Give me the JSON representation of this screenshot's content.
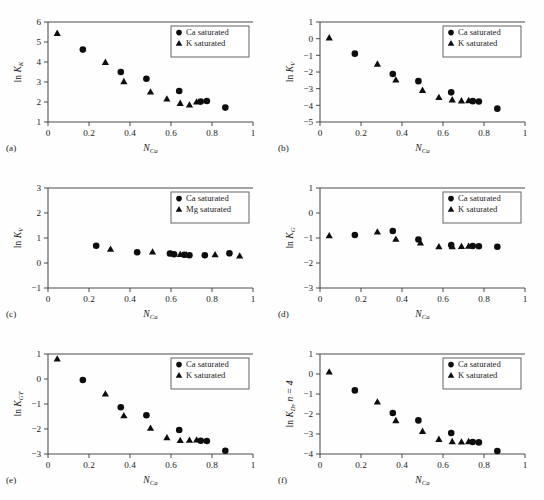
{
  "figure": {
    "width": 544,
    "height": 500,
    "background": "#fefefe",
    "marker_color": "#0d0d0d",
    "axis_color": "#4a4a4a"
  },
  "chart_data": [
    {
      "type": "scatter",
      "panel": "(a)",
      "title": "",
      "xlabel": "N_Ca",
      "ylabel": "ln K_K",
      "xlim": [
        0,
        1
      ],
      "ylim": [
        1,
        6
      ],
      "xticks": [
        0,
        0.2,
        0.4,
        0.6,
        0.8,
        1
      ],
      "xticklabels": [
        "0",
        "0.2",
        "0.4",
        "0.6",
        "0.8",
        "1"
      ],
      "yticks": [
        1,
        2,
        3,
        4,
        5,
        6
      ],
      "yticklabels": [
        "1",
        "2",
        "3",
        "4",
        "5",
        "6"
      ],
      "grid": false,
      "legend_position": "upper right",
      "series": [
        {
          "name": "Ca saturated",
          "marker": "circle",
          "x": [
            0.17,
            0.355,
            0.48,
            0.64,
            0.745,
            0.775,
            0.865
          ],
          "y": [
            4.62,
            3.5,
            3.16,
            2.55,
            2.02,
            2.05,
            1.72
          ]
        },
        {
          "name": "K saturated",
          "marker": "triangle",
          "x": [
            0.045,
            0.28,
            0.37,
            0.5,
            0.58,
            0.645,
            0.69,
            0.725
          ],
          "y": [
            5.43,
            3.98,
            3.02,
            2.5,
            2.15,
            1.93,
            1.85,
            2.0
          ]
        }
      ]
    },
    {
      "type": "scatter",
      "panel": "(b)",
      "title": "",
      "xlabel": "N_Ca",
      "ylabel": "ln K_V",
      "xlim": [
        0,
        1
      ],
      "ylim": [
        -5,
        1
      ],
      "xticks": [
        0,
        0.2,
        0.4,
        0.6,
        0.8,
        1
      ],
      "xticklabels": [
        "0",
        "0.2",
        "0.4",
        "0.6",
        "0.8",
        "1"
      ],
      "yticks": [
        -5,
        -4,
        -3,
        -2,
        -1,
        0,
        1
      ],
      "yticklabels": [
        "−5",
        "−4",
        "−3",
        "−2",
        "−1",
        "0",
        "1"
      ],
      "grid": false,
      "legend_position": "upper right",
      "series": [
        {
          "name": "Ca saturated",
          "marker": "circle",
          "x": [
            0.17,
            0.355,
            0.48,
            0.64,
            0.745,
            0.775,
            0.865
          ],
          "y": [
            -0.9,
            -2.12,
            -2.55,
            -3.22,
            -3.75,
            -3.77,
            -4.2
          ]
        },
        {
          "name": "K saturated",
          "marker": "triangle",
          "x": [
            0.045,
            0.28,
            0.37,
            0.5,
            0.58,
            0.645,
            0.69,
            0.725
          ],
          "y": [
            0.05,
            -1.53,
            -2.48,
            -3.1,
            -3.53,
            -3.67,
            -3.73,
            -3.72
          ]
        }
      ]
    },
    {
      "type": "scatter",
      "panel": "(c)",
      "title": "",
      "xlabel": "N_Ca",
      "ylabel": "ln K_V",
      "xlim": [
        0,
        1
      ],
      "ylim": [
        -1,
        3
      ],
      "xticks": [
        0,
        0.2,
        0.4,
        0.6,
        0.8,
        1
      ],
      "xticklabels": [
        "0",
        "0.2",
        "0.4",
        "0.6",
        "0.8",
        "1"
      ],
      "yticks": [
        -1,
        0,
        1,
        2,
        3
      ],
      "yticklabels": [
        "−1",
        "0",
        "1",
        "2",
        "3"
      ],
      "grid": false,
      "legend_position": "upper right",
      "series": [
        {
          "name": "Ca saturated",
          "marker": "circle",
          "x": [
            0.235,
            0.435,
            0.595,
            0.615,
            0.665,
            0.69,
            0.765,
            0.885
          ],
          "y": [
            0.69,
            0.43,
            0.38,
            0.35,
            0.33,
            0.31,
            0.31,
            0.39
          ]
        },
        {
          "name": "Mg saturated",
          "marker": "triangle",
          "x": [
            0.305,
            0.51,
            0.6,
            0.645,
            0.675,
            0.815,
            0.935
          ],
          "y": [
            0.55,
            0.44,
            0.37,
            0.34,
            0.32,
            0.33,
            0.28
          ]
        }
      ]
    },
    {
      "type": "scatter",
      "panel": "(d)",
      "title": "",
      "xlabel": "N_Ca",
      "ylabel": "ln K_G",
      "xlim": [
        0,
        1
      ],
      "ylim": [
        -3,
        1
      ],
      "xticks": [
        0,
        0.2,
        0.4,
        0.6,
        0.8,
        1
      ],
      "xticklabels": [
        "0",
        "0.2",
        "0.4",
        "0.6",
        "0.8",
        "1"
      ],
      "yticks": [
        -3,
        -2,
        -1,
        0,
        1
      ],
      "yticklabels": [
        "−3",
        "−2",
        "−1",
        "0",
        "1"
      ],
      "grid": false,
      "legend_position": "upper right",
      "series": [
        {
          "name": "Ca saturated",
          "marker": "circle",
          "x": [
            0.17,
            0.355,
            0.48,
            0.64,
            0.745,
            0.775,
            0.865
          ],
          "y": [
            -0.88,
            -0.72,
            -1.06,
            -1.28,
            -1.32,
            -1.33,
            -1.35
          ]
        },
        {
          "name": "K saturated",
          "marker": "triangle",
          "x": [
            0.045,
            0.28,
            0.37,
            0.49,
            0.58,
            0.645,
            0.69,
            0.725
          ],
          "y": [
            -0.91,
            -0.76,
            -1.05,
            -1.2,
            -1.35,
            -1.35,
            -1.34,
            -1.33
          ]
        }
      ]
    },
    {
      "type": "scatter",
      "panel": "(e)",
      "title": "",
      "xlabel": "N_Ca",
      "ylabel": "ln K_GT",
      "xlim": [
        0,
        1
      ],
      "ylim": [
        -3,
        1
      ],
      "xticks": [
        0,
        0.2,
        0.4,
        0.6,
        0.8,
        1
      ],
      "xticklabels": [
        "0",
        "0.2",
        "0.4",
        "0.6",
        "0.8",
        "1"
      ],
      "yticks": [
        -3,
        -2,
        -1,
        0,
        1
      ],
      "yticklabels": [
        "−3",
        "−2",
        "−1",
        "0",
        "1"
      ],
      "grid": false,
      "legend_position": "upper right",
      "series": [
        {
          "name": "Ca saturated",
          "marker": "circle",
          "x": [
            0.17,
            0.355,
            0.48,
            0.64,
            0.745,
            0.775,
            0.865
          ],
          "y": [
            -0.04,
            -1.13,
            -1.45,
            -2.04,
            -2.47,
            -2.48,
            -2.87
          ]
        },
        {
          "name": "K saturated",
          "marker": "triangle",
          "x": [
            0.045,
            0.28,
            0.37,
            0.5,
            0.58,
            0.645,
            0.69,
            0.725
          ],
          "y": [
            0.8,
            -0.6,
            -1.47,
            -1.97,
            -2.35,
            -2.46,
            -2.45,
            -2.44
          ]
        }
      ]
    },
    {
      "type": "scatter",
      "panel": "(f)",
      "title": "",
      "xlabel": "N_Ca",
      "ylabel": "ln K_D, n = 4",
      "xlim": [
        0,
        1
      ],
      "ylim": [
        -4,
        1
      ],
      "xticks": [
        0,
        0.2,
        0.4,
        0.6,
        0.8,
        1
      ],
      "xticklabels": [
        "0",
        "0.2",
        "0.4",
        "0.6",
        "0.8",
        "1"
      ],
      "yticks": [
        -4,
        -3,
        -2,
        -1,
        0,
        1
      ],
      "yticklabels": [
        "−4",
        "−3",
        "−2",
        "−1",
        "0",
        "1"
      ],
      "grid": false,
      "legend_position": "upper right",
      "series": [
        {
          "name": "Ca saturated",
          "marker": "circle",
          "x": [
            0.17,
            0.355,
            0.48,
            0.64,
            0.745,
            0.775,
            0.865
          ],
          "y": [
            -0.82,
            -1.95,
            -2.32,
            -2.95,
            -3.4,
            -3.42,
            -3.85
          ]
        },
        {
          "name": "K saturated",
          "marker": "triangle",
          "x": [
            0.045,
            0.28,
            0.37,
            0.5,
            0.58,
            0.645,
            0.69,
            0.725
          ],
          "y": [
            0.1,
            -1.4,
            -2.33,
            -2.87,
            -3.27,
            -3.38,
            -3.4,
            -3.38
          ]
        }
      ]
    }
  ],
  "panels": {
    "a": {
      "letter": "(a)",
      "ylabel_main": "ln K",
      "ylabel_sub": "K",
      "xlabel_main": "N",
      "xlabel_sub": "Ca"
    },
    "b": {
      "letter": "(b)",
      "ylabel_main": "ln K",
      "ylabel_sub": "V",
      "xlabel_main": "N",
      "xlabel_sub": "Ca"
    },
    "c": {
      "letter": "(c)",
      "ylabel_main": "ln K",
      "ylabel_sub": "V",
      "xlabel_main": "N",
      "xlabel_sub": "Ca"
    },
    "d": {
      "letter": "(d)",
      "ylabel_main": "ln K",
      "ylabel_sub": "G",
      "xlabel_main": "N",
      "xlabel_sub": "Ca"
    },
    "e": {
      "letter": "(e)",
      "ylabel_main": "ln K",
      "ylabel_sub": "GT",
      "xlabel_main": "N",
      "xlabel_sub": "Ca"
    },
    "f": {
      "letter": "(f)",
      "ylabel_main": "ln K",
      "ylabel_sub": "D",
      "ylabel_tail": ", n = 4",
      "xlabel_main": "N",
      "xlabel_sub": "Ca"
    }
  },
  "legends": {
    "ca": "Ca saturated",
    "k": "K saturated",
    "mg": "Mg saturated"
  }
}
